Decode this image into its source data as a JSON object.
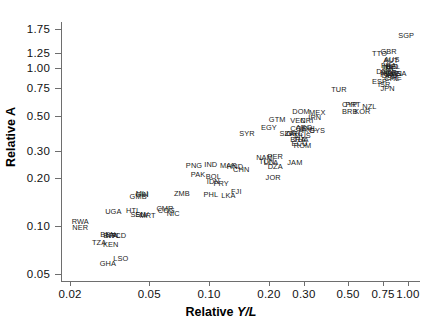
{
  "chart_data": {
    "type": "scatter",
    "title": "",
    "xlabel": "Relative Y/L",
    "ylabel": "Relative A",
    "xscale": "log",
    "yscale": "log",
    "xlim": [
      0.018,
      1.15
    ],
    "ylim": [
      0.045,
      1.95
    ],
    "grid": false,
    "legend": null,
    "xticks": [
      "0.02",
      "0.05",
      "0.10",
      "0.20",
      "0.30",
      "0.50",
      "0.75",
      "1.00"
    ],
    "xtick_values": [
      0.02,
      0.05,
      0.1,
      0.2,
      0.3,
      0.5,
      0.75,
      1.0
    ],
    "yticks": [
      "0.05",
      "0.10",
      "0.20",
      "0.30",
      "0.50",
      "0.75",
      "1.00",
      "1.25",
      "1.75"
    ],
    "ytick_values": [
      0.05,
      0.1,
      0.2,
      0.3,
      0.5,
      0.75,
      1.0,
      1.25,
      1.75
    ],
    "marker": "text-label",
    "points": [
      {
        "label": "SGP",
        "x": 0.98,
        "y": 1.58
      },
      {
        "label": "GBR",
        "x": 0.8,
        "y": 1.26
      },
      {
        "label": "TTO",
        "x": 0.72,
        "y": 1.22
      },
      {
        "label": "AUS",
        "x": 0.83,
        "y": 1.12
      },
      {
        "label": "AUT",
        "x": 0.82,
        "y": 1.1
      },
      {
        "label": "FRA",
        "x": 0.8,
        "y": 1.03
      },
      {
        "label": "NLD",
        "x": 0.82,
        "y": 1.02
      },
      {
        "label": "BEL",
        "x": 0.84,
        "y": 1.01
      },
      {
        "label": "ITA",
        "x": 0.79,
        "y": 1.0
      },
      {
        "label": "IRL",
        "x": 0.81,
        "y": 0.99
      },
      {
        "label": "DNK",
        "x": 0.76,
        "y": 0.94
      },
      {
        "label": "NOR",
        "x": 0.8,
        "y": 0.93
      },
      {
        "label": "SWE",
        "x": 0.83,
        "y": 0.92
      },
      {
        "label": "CAN",
        "x": 0.85,
        "y": 0.92
      },
      {
        "label": "USA",
        "x": 0.9,
        "y": 0.91
      },
      {
        "label": "FIN",
        "x": 0.78,
        "y": 0.9
      },
      {
        "label": "DEU",
        "x": 0.81,
        "y": 0.89
      },
      {
        "label": "CHE",
        "x": 0.85,
        "y": 0.86
      },
      {
        "label": "CHL",
        "x": 0.83,
        "y": 0.85
      },
      {
        "label": "ESP",
        "x": 0.72,
        "y": 0.82
      },
      {
        "label": "ISR",
        "x": 0.76,
        "y": 0.78
      },
      {
        "label": "JPN",
        "x": 0.79,
        "y": 0.74
      },
      {
        "label": "TUR",
        "x": 0.45,
        "y": 0.73
      },
      {
        "label": "CYP",
        "x": 0.51,
        "y": 0.58
      },
      {
        "label": "PRT",
        "x": 0.53,
        "y": 0.58
      },
      {
        "label": "NZL",
        "x": 0.64,
        "y": 0.57
      },
      {
        "label": "BRB",
        "x": 0.51,
        "y": 0.53
      },
      {
        "label": "KOR",
        "x": 0.59,
        "y": 0.53
      },
      {
        "label": "DOM",
        "x": 0.29,
        "y": 0.53
      },
      {
        "label": "MEX",
        "x": 0.35,
        "y": 0.52
      },
      {
        "label": "GTM",
        "x": 0.22,
        "y": 0.47
      },
      {
        "label": "VEN",
        "x": 0.28,
        "y": 0.46
      },
      {
        "label": "CRI",
        "x": 0.31,
        "y": 0.46
      },
      {
        "label": "IRN",
        "x": 0.34,
        "y": 0.48
      },
      {
        "label": "EGY",
        "x": 0.2,
        "y": 0.42
      },
      {
        "label": "ARG",
        "x": 0.3,
        "y": 0.42
      },
      {
        "label": "COL",
        "x": 0.28,
        "y": 0.41
      },
      {
        "label": "PHL",
        "x": 0.32,
        "y": 0.41
      },
      {
        "label": "HKG",
        "x": 0.31,
        "y": 0.4
      },
      {
        "label": "CYS",
        "x": 0.35,
        "y": 0.4
      },
      {
        "label": "SYR",
        "x": 0.155,
        "y": 0.38
      },
      {
        "label": "SLV",
        "x": 0.245,
        "y": 0.38
      },
      {
        "label": "ZAF",
        "x": 0.26,
        "y": 0.38
      },
      {
        "label": "GRC",
        "x": 0.27,
        "y": 0.38
      },
      {
        "label": "MUS",
        "x": 0.295,
        "y": 0.37
      },
      {
        "label": "BRA",
        "x": 0.28,
        "y": 0.35
      },
      {
        "label": "THA",
        "x": 0.29,
        "y": 0.35
      },
      {
        "label": "ECU",
        "x": 0.285,
        "y": 0.33
      },
      {
        "label": "ROM",
        "x": 0.295,
        "y": 0.32
      },
      {
        "label": "NAM",
        "x": 0.19,
        "y": 0.27
      },
      {
        "label": "PER",
        "x": 0.215,
        "y": 0.275
      },
      {
        "label": "TUN",
        "x": 0.195,
        "y": 0.255
      },
      {
        "label": "LCA",
        "x": 0.205,
        "y": 0.25
      },
      {
        "label": "DZA",
        "x": 0.215,
        "y": 0.235
      },
      {
        "label": "JAM",
        "x": 0.27,
        "y": 0.25
      },
      {
        "label": "CHN",
        "x": 0.145,
        "y": 0.225
      },
      {
        "label": "JOR",
        "x": 0.21,
        "y": 0.2
      },
      {
        "label": "IND",
        "x": 0.102,
        "y": 0.245
      },
      {
        "label": "MAR",
        "x": 0.125,
        "y": 0.24
      },
      {
        "label": "HND",
        "x": 0.135,
        "y": 0.235
      },
      {
        "label": "PNG",
        "x": 0.084,
        "y": 0.24
      },
      {
        "label": "PAK",
        "x": 0.088,
        "y": 0.21
      },
      {
        "label": "BOL",
        "x": 0.105,
        "y": 0.205
      },
      {
        "label": "IDN",
        "x": 0.105,
        "y": 0.19
      },
      {
        "label": "PRY",
        "x": 0.115,
        "y": 0.185
      },
      {
        "label": "FJI",
        "x": 0.137,
        "y": 0.165
      },
      {
        "label": "LKA",
        "x": 0.125,
        "y": 0.155
      },
      {
        "label": "PHL2",
        "x": 0.102,
        "y": 0.158
      },
      {
        "label": "ZMB",
        "x": 0.073,
        "y": 0.16
      },
      {
        "label": "MLI",
        "x": 0.046,
        "y": 0.16
      },
      {
        "label": "GIN",
        "x": 0.046,
        "y": 0.157
      },
      {
        "label": "GMB",
        "x": 0.044,
        "y": 0.152
      },
      {
        "label": "CMR",
        "x": 0.06,
        "y": 0.129
      },
      {
        "label": "COG",
        "x": 0.061,
        "y": 0.124
      },
      {
        "label": "NIC",
        "x": 0.066,
        "y": 0.119
      },
      {
        "label": "HTI",
        "x": 0.041,
        "y": 0.124
      },
      {
        "label": "SEN",
        "x": 0.044,
        "y": 0.118
      },
      {
        "label": "SLV2",
        "x": 0.046,
        "y": 0.117
      },
      {
        "label": "MRT",
        "x": 0.049,
        "y": 0.116
      },
      {
        "label": "UGA",
        "x": 0.033,
        "y": 0.122
      },
      {
        "label": "RWA",
        "x": 0.0225,
        "y": 0.106
      },
      {
        "label": "NER",
        "x": 0.0225,
        "y": 0.097
      },
      {
        "label": "BEN",
        "x": 0.031,
        "y": 0.088
      },
      {
        "label": "BFA",
        "x": 0.032,
        "y": 0.087
      },
      {
        "label": "NPL",
        "x": 0.033,
        "y": 0.087
      },
      {
        "label": "TCD",
        "x": 0.035,
        "y": 0.086
      },
      {
        "label": "TZA",
        "x": 0.028,
        "y": 0.078
      },
      {
        "label": "KEN",
        "x": 0.032,
        "y": 0.076
      },
      {
        "label": "LSO",
        "x": 0.036,
        "y": 0.062
      },
      {
        "label": "GHA",
        "x": 0.031,
        "y": 0.058
      }
    ]
  }
}
